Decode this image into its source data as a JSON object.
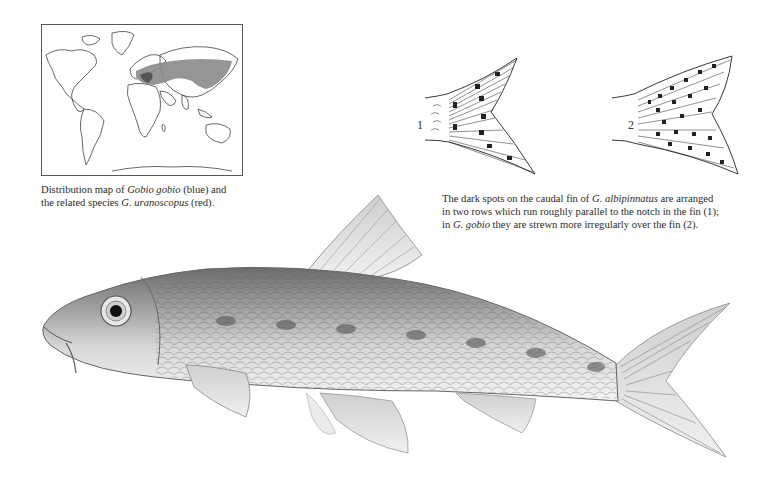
{
  "page": {
    "type": "field-guide-illustration-page",
    "background": "#ffffff"
  },
  "map": {
    "figure": "world-distribution-map",
    "regions": [
      {
        "species": "Gobio gobio",
        "legend_color_name": "blue",
        "rendered_color": "#8a8a8a",
        "area": "Europe to eastern Asia"
      },
      {
        "species": "G. uranoscopus",
        "legend_color_name": "red",
        "rendered_color": "#5a5a5a",
        "area": "central/eastern Europe"
      }
    ],
    "caption": {
      "part1": "Distribution map of ",
      "species1": "Gobio gobio",
      "part2": " (blue) and",
      "part3": "the related species ",
      "species2": "G. uranoscopus",
      "part4": " (red)."
    }
  },
  "fins": {
    "items": [
      {
        "label": "1",
        "species": "G. albipinnatus",
        "pattern": "two rows of spots parallel to notch"
      },
      {
        "label": "2",
        "species": "G. gobio",
        "pattern": "spots strewn irregularly"
      }
    ],
    "caption": {
      "part1": "The dark spots on the caudal fin of ",
      "species1": "G. albipinnatus",
      "part2": " are arranged",
      "line2": "in two rows which run roughly parallel to the notch in the fin (1);",
      "part3": "in ",
      "species2": "G. gobio",
      "part4": " they are strewn more irregularly over the fin (2)."
    }
  },
  "main_illustration": {
    "subject": "gudgeon-fish",
    "species": "Gobio gobio",
    "orientation": "facing left"
  }
}
